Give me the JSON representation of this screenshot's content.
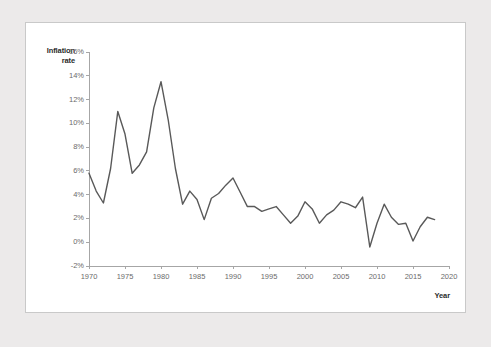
{
  "chart_data": {
    "type": "line",
    "title": "",
    "xlabel": "Year",
    "ylabel": "Inflation rate",
    "ylabel_lines": [
      "Inflation",
      "rate"
    ],
    "xlim": [
      1970,
      2020
    ],
    "ylim": [
      -2,
      16
    ],
    "xticks": [
      1970,
      1975,
      1980,
      1985,
      1990,
      1995,
      2000,
      2005,
      2010,
      2015,
      2020
    ],
    "xtick_labels": [
      "1970",
      "1975",
      "1980",
      "1985",
      "1990",
      "1995",
      "2000",
      "2005",
      "2010",
      "2015",
      "2020"
    ],
    "yticks": [
      -2,
      0,
      2,
      4,
      6,
      8,
      10,
      12,
      14,
      16
    ],
    "ytick_labels": [
      "-2%",
      "0%",
      "2%",
      "4%",
      "6%",
      "8%",
      "10%",
      "12%",
      "14%",
      "16%"
    ],
    "grid": false,
    "legend": false,
    "line_color": "#595959",
    "line_width": 1.4,
    "axis_color": "#a6a6a6",
    "x": [
      1970,
      1971,
      1972,
      1973,
      1974,
      1975,
      1976,
      1977,
      1978,
      1979,
      1980,
      1981,
      1982,
      1983,
      1984,
      1985,
      1986,
      1987,
      1988,
      1989,
      1990,
      1991,
      1992,
      1993,
      1994,
      1995,
      1996,
      1997,
      1998,
      1999,
      2000,
      2001,
      2002,
      2003,
      2004,
      2005,
      2006,
      2007,
      2008,
      2009,
      2010,
      2011,
      2012,
      2013,
      2014,
      2015,
      2016,
      2017,
      2018
    ],
    "values": [
      5.8,
      4.3,
      3.3,
      6.2,
      11.0,
      9.1,
      5.8,
      6.5,
      7.6,
      11.3,
      13.5,
      10.3,
      6.2,
      3.2,
      4.3,
      3.6,
      1.9,
      3.7,
      4.1,
      4.8,
      5.4,
      4.2,
      3.0,
      3.0,
      2.6,
      2.8,
      3.0,
      2.3,
      1.6,
      2.2,
      3.4,
      2.8,
      1.6,
      2.3,
      2.7,
      3.4,
      3.2,
      2.9,
      3.8,
      -0.4,
      1.6,
      3.2,
      2.1,
      1.5,
      1.6,
      0.1,
      1.3,
      2.1,
      1.9
    ]
  }
}
